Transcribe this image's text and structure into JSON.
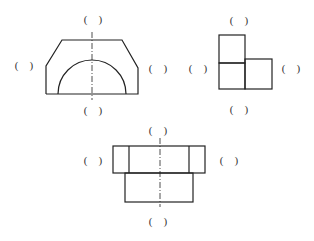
{
  "labels": {
    "blank": "(    )"
  },
  "views": [
    {
      "name": "trapezoid-arch-view"
    },
    {
      "name": "l-shape-view"
    },
    {
      "name": "stepped-block-view"
    }
  ],
  "colors": {
    "line": "#222222",
    "text": "#333333"
  }
}
